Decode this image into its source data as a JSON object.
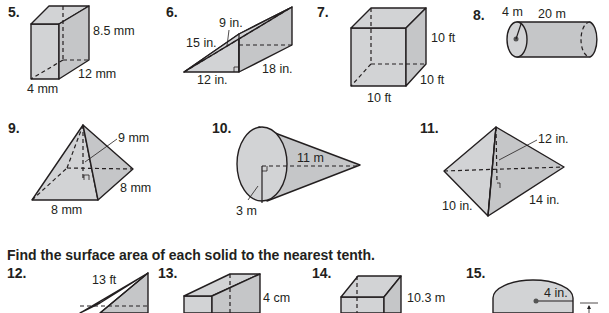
{
  "instruction": "Find the surface area of each solid to the nearest tenth.",
  "problems": [
    {
      "number": "5.",
      "solid": "rectangular prism",
      "labels": [
        "8.5 mm",
        "12 mm",
        "4 mm"
      ]
    },
    {
      "number": "6.",
      "solid": "triangular prism",
      "labels": [
        "9 in.",
        "15 in.",
        "12 in.",
        "18 in."
      ]
    },
    {
      "number": "7.",
      "solid": "cube",
      "labels": [
        "10 ft",
        "10 ft",
        "10 ft"
      ]
    },
    {
      "number": "8.",
      "solid": "cylinder",
      "labels": [
        "4 m",
        "20 m"
      ]
    },
    {
      "number": "9.",
      "solid": "square pyramid",
      "labels": [
        "9 mm",
        "8 mm",
        "8 mm"
      ]
    },
    {
      "number": "10.",
      "solid": "cone",
      "labels": [
        "11 m",
        "3 m"
      ]
    },
    {
      "number": "11.",
      "solid": "rectangular pyramid",
      "labels": [
        "12 in.",
        "10 in.",
        "14 in."
      ]
    },
    {
      "number": "12.",
      "solid": "triangular prism",
      "labels": [
        "13 ft"
      ]
    },
    {
      "number": "13.",
      "solid": "rectangular prism",
      "labels": [
        "4 cm"
      ]
    },
    {
      "number": "14.",
      "solid": "rectangular prism",
      "labels": [
        "10.3 m"
      ]
    },
    {
      "number": "15.",
      "solid": "cylinder",
      "labels": [
        "4 in."
      ]
    }
  ]
}
